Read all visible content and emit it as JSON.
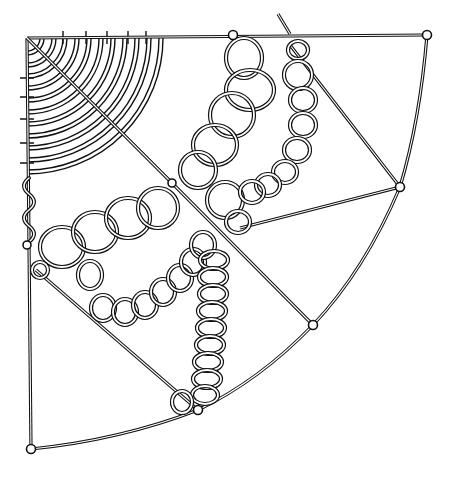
{
  "illustration": {
    "subject": "quarter-circle wire frame with looped cord chains",
    "colors": {
      "line": "#111111",
      "background": "#ffffff"
    },
    "frame": {
      "corner": [
        27,
        38
      ],
      "top_end": [
        427,
        35
      ],
      "left_end": [
        31,
        449
      ],
      "arc_points": [
        [
          427,
          35
        ],
        [
          400,
          187
        ],
        [
          313,
          325
        ],
        [
          198,
          410
        ],
        [
          31,
          449
        ]
      ]
    },
    "nodes": [
      [
        233,
        35
      ],
      [
        427,
        35
      ],
      [
        400,
        187
      ],
      [
        313,
        325
      ],
      [
        198,
        410
      ],
      [
        31,
        449
      ],
      [
        27,
        245
      ],
      [
        172,
        183
      ]
    ],
    "concentric_arc_count": 11,
    "loop_chains": [
      {
        "name": "top-right-chain",
        "count": 10
      },
      {
        "name": "left-sweep-chain",
        "count": 9
      },
      {
        "name": "vertical-chain",
        "count": 10
      },
      {
        "name": "large-loop-chain",
        "count": 6
      }
    ]
  }
}
